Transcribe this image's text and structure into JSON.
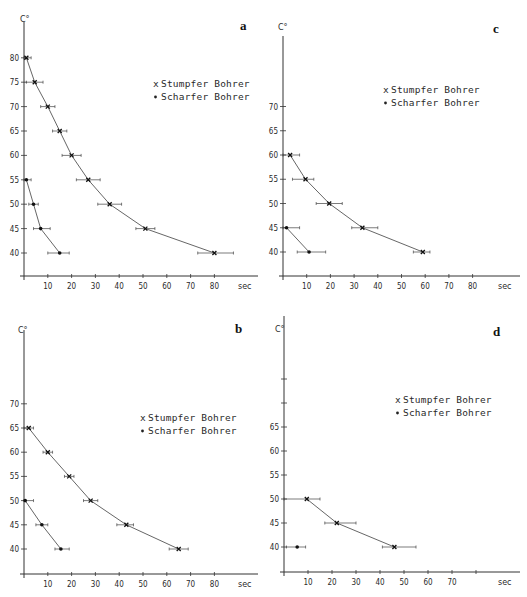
{
  "figure": {
    "y_unit_label": "C°",
    "x_unit_label": "sec",
    "legend": {
      "stumpfer": {
        "marker": "x",
        "label": "Stumpfer Bohrer"
      },
      "scharfer": {
        "marker": "•",
        "label": "Scharfer Bohrer"
      }
    }
  },
  "chart_data": [
    {
      "panel": "a",
      "type": "line",
      "title": "a",
      "xlabel": "sec",
      "ylabel": "C°",
      "x_ticks": [
        10,
        20,
        30,
        40,
        50,
        60,
        70,
        80
      ],
      "y_ticks": [
        40,
        45,
        50,
        55,
        60,
        65,
        70,
        75,
        80
      ],
      "legend_position": "upper right",
      "grid": false,
      "series": [
        {
          "name": "Stumpfer Bohrer",
          "marker": "x",
          "points": [
            {
              "x": 1,
              "y": 80,
              "xerr": [
                0,
                3
              ]
            },
            {
              "x": 4.5,
              "y": 75,
              "xerr": [
                1,
                8
              ]
            },
            {
              "x": 10,
              "y": 70,
              "xerr": [
                7,
                13
              ]
            },
            {
              "x": 15,
              "y": 65,
              "xerr": [
                12,
                18
              ]
            },
            {
              "x": 20,
              "y": 60,
              "xerr": [
                16,
                24
              ]
            },
            {
              "x": 27,
              "y": 55,
              "xerr": [
                22,
                32
              ]
            },
            {
              "x": 36,
              "y": 50,
              "xerr": [
                31,
                41
              ]
            },
            {
              "x": 51,
              "y": 45,
              "xerr": [
                47,
                55
              ]
            },
            {
              "x": 80,
              "y": 40,
              "xerr": [
                73,
                88
              ]
            }
          ]
        },
        {
          "name": "Scharfer Bohrer",
          "marker": "•",
          "points": [
            {
              "x": 1,
              "y": 55,
              "xerr": [
                0,
                3
              ]
            },
            {
              "x": 4,
              "y": 50,
              "xerr": [
                2,
                6
              ]
            },
            {
              "x": 7,
              "y": 45,
              "xerr": [
                4,
                11
              ]
            },
            {
              "x": 15,
              "y": 40,
              "xerr": [
                10,
                19
              ]
            }
          ]
        }
      ]
    },
    {
      "panel": "c",
      "type": "line",
      "title": "c",
      "xlabel": "sec",
      "ylabel": "C°",
      "x_ticks": [
        10,
        20,
        30,
        40,
        50,
        60,
        70,
        80
      ],
      "y_ticks": [
        40,
        45,
        50,
        55,
        60,
        65,
        70
      ],
      "legend_position": "upper right",
      "grid": false,
      "series": [
        {
          "name": "Stumpfer Bohrer",
          "marker": "x",
          "points": [
            {
              "x": 3,
              "y": 60,
              "xerr": [
                0,
                7
              ]
            },
            {
              "x": 9.5,
              "y": 55,
              "xerr": [
                4,
                13
              ]
            },
            {
              "x": 19.5,
              "y": 50,
              "xerr": [
                14,
                25
              ]
            },
            {
              "x": 33.5,
              "y": 45,
              "xerr": [
                29,
                40
              ]
            },
            {
              "x": 59,
              "y": 40,
              "xerr": [
                55,
                62
              ]
            }
          ]
        },
        {
          "name": "Scharfer Bohrer",
          "marker": "•",
          "points": [
            {
              "x": 1.5,
              "y": 45,
              "xerr": [
                0,
                7
              ]
            },
            {
              "x": 11,
              "y": 40,
              "xerr": [
                6,
                18
              ]
            }
          ]
        }
      ]
    },
    {
      "panel": "b",
      "type": "line",
      "title": "b",
      "xlabel": "sec",
      "ylabel": "C°",
      "x_ticks": [
        10,
        20,
        30,
        40,
        50,
        60,
        70,
        80
      ],
      "y_ticks": [
        40,
        45,
        50,
        55,
        60,
        65,
        70
      ],
      "legend_position": "center right",
      "grid": false,
      "series": [
        {
          "name": "Stumpfer Bohrer",
          "marker": "x",
          "points": [
            {
              "x": 2,
              "y": 65,
              "xerr": [
                0,
                4
              ]
            },
            {
              "x": 10,
              "y": 60,
              "xerr": [
                8,
                12
              ]
            },
            {
              "x": 19,
              "y": 55,
              "xerr": [
                17,
                21
              ]
            },
            {
              "x": 28,
              "y": 50,
              "xerr": [
                25,
                31
              ]
            },
            {
              "x": 43,
              "y": 45,
              "xerr": [
                39,
                46
              ]
            },
            {
              "x": 65,
              "y": 40,
              "xerr": [
                61,
                69
              ]
            }
          ]
        },
        {
          "name": "Scharfer Bohrer",
          "marker": "•",
          "points": [
            {
              "x": 0.5,
              "y": 50,
              "xerr": [
                0,
                4
              ]
            },
            {
              "x": 7.5,
              "y": 45,
              "xerr": [
                5,
                10
              ]
            },
            {
              "x": 15.5,
              "y": 40,
              "xerr": [
                13,
                19
              ]
            }
          ]
        }
      ]
    },
    {
      "panel": "d",
      "type": "line",
      "title": "d",
      "xlabel": "sec",
      "ylabel": "C°",
      "x_ticks": [
        10,
        20,
        30,
        40,
        50,
        60,
        70
      ],
      "x_extra_unlabeled_ticks": [
        80
      ],
      "y_ticks": [
        40,
        45,
        50,
        55,
        60,
        65
      ],
      "y_extra_unlabeled_ticks": [
        70,
        75
      ],
      "legend_position": "center right",
      "grid": false,
      "series": [
        {
          "name": "Stumpfer Bohrer",
          "marker": "x",
          "points": [
            {
              "x": 9.5,
              "y": 50,
              "xerr": [
                0,
                15
              ]
            },
            {
              "x": 22,
              "y": 45,
              "xerr": [
                17,
                30
              ]
            },
            {
              "x": 46,
              "y": 40,
              "xerr": [
                41,
                55
              ]
            }
          ]
        },
        {
          "name": "Scharfer Bohrer",
          "marker": "•",
          "points": [
            {
              "x": 5.5,
              "y": 40,
              "xerr": [
                1,
                9
              ]
            }
          ]
        }
      ]
    }
  ],
  "panels_layout": [
    {
      "panel": "a",
      "ox": 24,
      "xaxis_y": 276,
      "y40": 253,
      "px_per_deg": 4.88,
      "px_per_sec": 2.38,
      "axis_top": 22,
      "axis_right": 258,
      "x_label_y": 289,
      "sec_x": 238,
      "ylabel_pos": [
        20,
        22
      ],
      "letter_pos": [
        240,
        30
      ],
      "legend_pos": [
        153,
        87
      ]
    },
    {
      "panel": "c",
      "ox": 283,
      "xaxis_y": 276,
      "y40": 252,
      "px_per_deg": 4.85,
      "px_per_sec": 2.37,
      "axis_top": 36,
      "axis_right": 520,
      "x_label_y": 289,
      "sec_x": 498,
      "ylabel_pos": [
        278,
        30
      ],
      "letter_pos": [
        493,
        33
      ],
      "legend_pos": [
        383,
        93
      ]
    },
    {
      "panel": "b",
      "ox": 24,
      "xaxis_y": 574,
      "y40": 549,
      "px_per_deg": 4.84,
      "px_per_sec": 2.38,
      "axis_top": 330,
      "axis_right": 258,
      "x_label_y": 587,
      "sec_x": 238,
      "ylabel_pos": [
        18,
        333
      ],
      "letter_pos": [
        235,
        333
      ],
      "legend_pos": [
        140,
        421
      ]
    },
    {
      "panel": "d",
      "ox": 284,
      "xaxis_y": 572,
      "y40": 547,
      "px_per_deg": 4.8,
      "px_per_sec": 2.4,
      "axis_top": 316,
      "axis_right": 520,
      "x_label_y": 585,
      "sec_x": 498,
      "ylabel_pos": [
        275,
        332
      ],
      "letter_pos": [
        493,
        336
      ],
      "legend_pos": [
        395,
        403
      ]
    }
  ]
}
